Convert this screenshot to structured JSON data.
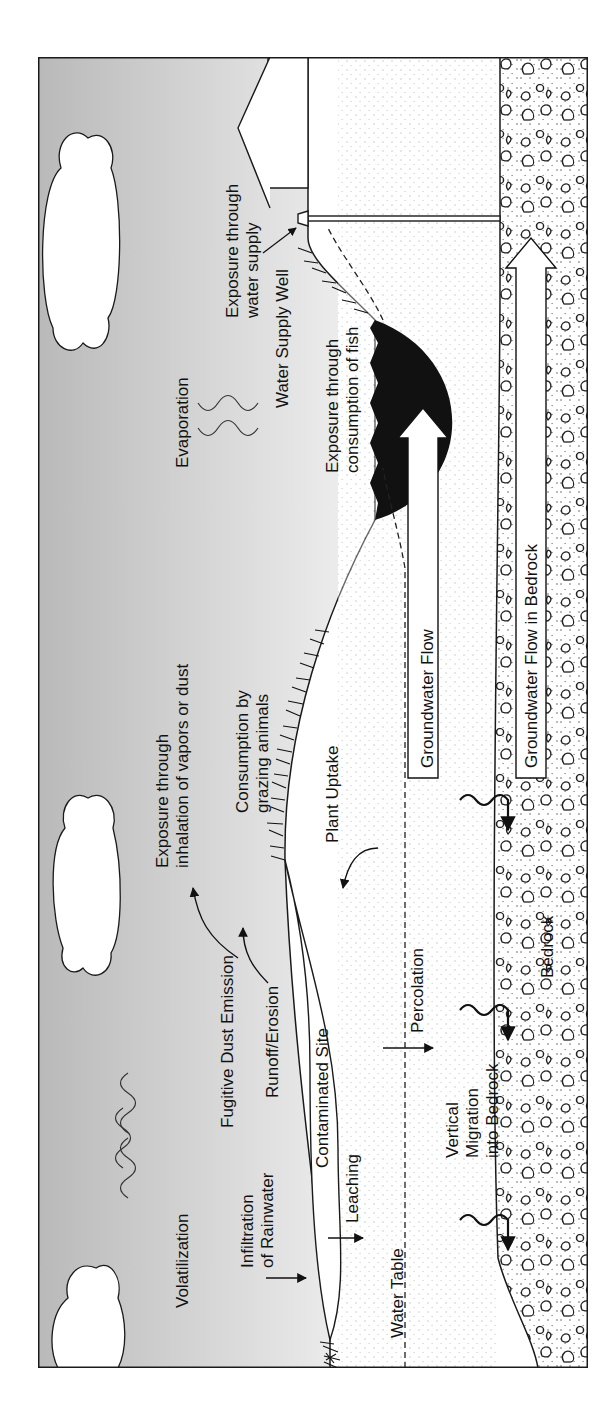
{
  "diagram": {
    "orientation": "rotated-90-ccw",
    "labels": {
      "volatilization": "Volatilization",
      "infiltration_line1": "Infiltration",
      "infiltration_line2": "of Rainwater",
      "fugitive_dust": "Fugitive Dust Emission",
      "runoff": "Runoff/Erosion",
      "contaminated_site": "Contaminated Site",
      "leaching": "Leaching",
      "water_table": "Water Table",
      "percolation": "Percolation",
      "vertical_line1": "Vertical",
      "vertical_line2": "Migration",
      "vertical_line3": "into Bedrock",
      "bedrock": "Bedrock",
      "inhalation_line1": "Exposure through",
      "inhalation_line2": "inhalation of vapors or dust",
      "grazing_line1": "Consumption by",
      "grazing_line2": "grazing animals",
      "plant_uptake": "Plant Uptake",
      "groundwater_flow": "Groundwater Flow",
      "groundwater_bedrock": "Groundwater Flow in Bedrock",
      "evaporation": "Evaporation",
      "fish_line1": "Exposure through",
      "fish_line2": "consumption of fish",
      "well": "Water Supply Well",
      "water_supply_line1": "Exposure through",
      "water_supply_line2": "water supply"
    },
    "colors": {
      "sky_dark": "#b9b9b9",
      "sky_light": "#ececec",
      "ground": "#ffffff",
      "pond": "#111111",
      "line": "#1a1a1a"
    }
  }
}
